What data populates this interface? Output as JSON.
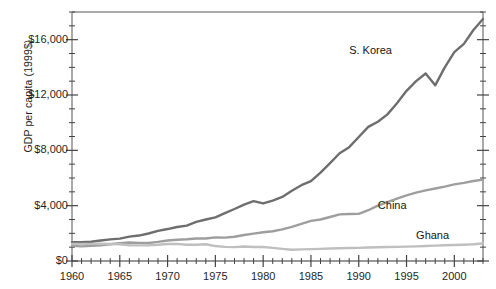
{
  "chart_data": {
    "type": "line",
    "title": "",
    "xlabel": "",
    "ylabel": "GDP per capita (1999$)",
    "xlim": [
      1960,
      2003
    ],
    "ylim": [
      0,
      18000
    ],
    "grid": false,
    "legend_position": "inline-labels",
    "y_ticks": [
      0,
      4000,
      8000,
      12000,
      16000
    ],
    "y_tick_labels": [
      "$0",
      "$4,000",
      "$8,000",
      "$12,000",
      "$16,000"
    ],
    "y_minor_tick_step": 1000,
    "x_ticks": [
      1960,
      1965,
      1970,
      1975,
      1980,
      1985,
      1990,
      1995,
      2000
    ],
    "x_tick_labels": [
      "1960",
      "1965",
      "1970",
      "1975",
      "1980",
      "1985",
      "1990",
      "1995",
      "2000"
    ],
    "x_minor_tick_step": 1,
    "x": [
      1960,
      1961,
      1962,
      1963,
      1964,
      1965,
      1966,
      1967,
      1968,
      1969,
      1970,
      1971,
      1972,
      1973,
      1974,
      1975,
      1976,
      1977,
      1978,
      1979,
      1980,
      1981,
      1982,
      1983,
      1984,
      1985,
      1986,
      1987,
      1988,
      1989,
      1990,
      1991,
      1992,
      1993,
      1994,
      1995,
      1996,
      1997,
      1998,
      1999,
      2000,
      2001,
      2002,
      2003
    ],
    "series": [
      {
        "name": "S. Korea",
        "color": "#6e6e6e",
        "values": [
          1350,
          1360,
          1390,
          1480,
          1560,
          1620,
          1760,
          1840,
          1990,
          2180,
          2310,
          2460,
          2560,
          2830,
          3000,
          3150,
          3460,
          3760,
          4080,
          4330,
          4160,
          4370,
          4630,
          5080,
          5480,
          5770,
          6390,
          7080,
          7790,
          8230,
          8960,
          9700,
          10070,
          10600,
          11400,
          12300,
          13000,
          13550,
          12700,
          14000,
          15100,
          15700,
          16700,
          17500
        ],
        "label_position": {
          "x": 1989,
          "y": 15200
        }
      },
      {
        "name": "China",
        "color": "#9e9e9e",
        "values": [
          1100,
          1060,
          1090,
          1140,
          1210,
          1290,
          1340,
          1310,
          1300,
          1380,
          1480,
          1540,
          1570,
          1630,
          1630,
          1710,
          1690,
          1750,
          1880,
          1980,
          2080,
          2150,
          2290,
          2470,
          2690,
          2900,
          3000,
          3180,
          3370,
          3400,
          3410,
          3670,
          4000,
          4260,
          4510,
          4740,
          4940,
          5110,
          5240,
          5380,
          5540,
          5650,
          5780,
          5880
        ],
        "label_position": {
          "x": 1992,
          "y": 3950
        }
      },
      {
        "name": "Ghana",
        "color": "#bfbfbf",
        "values": [
          1240,
          1230,
          1240,
          1250,
          1230,
          1210,
          1140,
          1130,
          1140,
          1170,
          1230,
          1240,
          1180,
          1180,
          1210,
          1080,
          1020,
          1000,
          1050,
          1010,
          1010,
          950,
          880,
          810,
          840,
          860,
          880,
          900,
          920,
          940,
          950,
          980,
          990,
          1010,
          1020,
          1040,
          1060,
          1080,
          1110,
          1140,
          1160,
          1180,
          1210,
          1260
        ],
        "label_position": {
          "x": 1996,
          "y": 1800
        }
      }
    ]
  },
  "plot_area": {
    "left_px": 72,
    "top_px": 12,
    "right_px": 483,
    "bottom_px": 261
  }
}
